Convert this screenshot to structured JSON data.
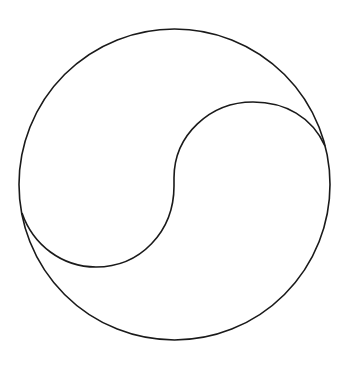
{
  "diagram": {
    "title": "",
    "background": "#ffffff",
    "stroke_color": "#1a1a1a",
    "stroke_width": 1.6,
    "outer_circle": {
      "cx": 174.5,
      "cy": 184.5,
      "r": 155.5
    },
    "s_curve": {
      "upper_arc": {
        "from": [
          325,
          146
        ],
        "peak": [
          253,
          102
        ],
        "to": [
          174,
          182
        ]
      },
      "lower_arc": {
        "from": [
          174,
          182
        ],
        "trough": [
          96,
          267
        ],
        "to": [
          22,
          213
        ]
      }
    }
  }
}
